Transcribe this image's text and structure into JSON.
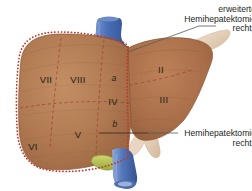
{
  "figure": {
    "organ": "liver",
    "view": "anterior"
  },
  "colors": {
    "liver_fill": "#b07a52",
    "liver_fill_light": "#c2895f",
    "liver_fill_dark": "#96613f",
    "liver_edge": "#8a5634",
    "resection_line": "#c1352a",
    "vein_blue": "#4a6fb5",
    "vein_blue_dark": "#2f4d8f",
    "ligament_beige": "#e3cdb6",
    "gallbladder_green": "#b9c45a",
    "text": "#231f20",
    "leader_line": "#595959"
  },
  "callouts": [
    {
      "name": "extended-right-hemihepatectomy",
      "lines": [
        "erweiterte",
        "Hemihepatektomie",
        "rechts"
      ]
    },
    {
      "name": "right-hemihepatectomy",
      "lines": [
        "Hemihepatektomie",
        "rechts"
      ]
    }
  ],
  "segments": [
    {
      "id": "VII",
      "label": "VII",
      "sub": "",
      "x": 46,
      "y": 79
    },
    {
      "id": "VIII",
      "label": "VIII",
      "sub": "",
      "x": 78,
      "y": 79
    },
    {
      "id": "IVa",
      "label": "",
      "sub": "a",
      "x": 114,
      "y": 78
    },
    {
      "id": "IV",
      "label": "IV",
      "sub": "",
      "x": 113,
      "y": 101
    },
    {
      "id": "IVb",
      "label": "",
      "sub": "b",
      "x": 115,
      "y": 124
    },
    {
      "id": "VI",
      "label": "VI",
      "sub": "",
      "x": 33,
      "y": 146
    },
    {
      "id": "V",
      "label": "V",
      "sub": "",
      "x": 78,
      "y": 134
    },
    {
      "id": "II",
      "label": "II",
      "sub": "",
      "x": 161,
      "y": 69
    },
    {
      "id": "III",
      "label": "III",
      "sub": "",
      "x": 164,
      "y": 99
    }
  ]
}
